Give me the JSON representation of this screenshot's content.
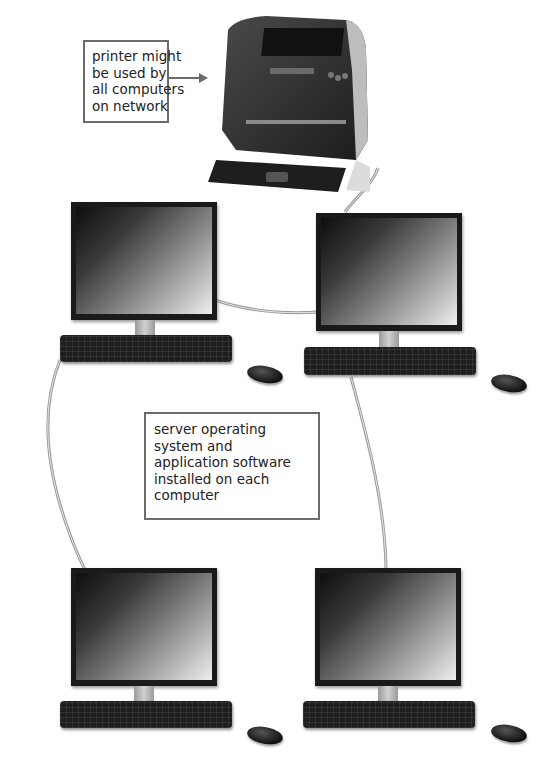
{
  "diagram": {
    "callouts": {
      "printer": {
        "lines": [
          "printer might",
          "be used by",
          "all computers",
          "on network"
        ]
      },
      "software": {
        "lines": [
          "server operating",
          "system and",
          "application software",
          "installed on each",
          "computer"
        ]
      }
    },
    "devices": [
      {
        "id": "printer",
        "type": "printer"
      },
      {
        "id": "computer-top-left",
        "type": "computer"
      },
      {
        "id": "computer-top-right",
        "type": "computer"
      },
      {
        "id": "computer-bottom-left",
        "type": "computer"
      },
      {
        "id": "computer-bottom-right",
        "type": "computer"
      }
    ],
    "connections": [
      [
        "printer",
        "computer-top-right"
      ],
      [
        "computer-top-left",
        "computer-top-right"
      ],
      [
        "computer-top-left",
        "computer-bottom-left"
      ],
      [
        "computer-top-right",
        "computer-bottom-right"
      ]
    ],
    "colors": {
      "callout_border": "#6b6b6b",
      "cable": "#9a9a9a",
      "device": "#1a1a1a"
    }
  }
}
